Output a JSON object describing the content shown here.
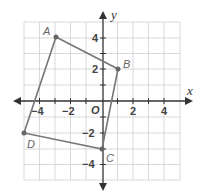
{
  "diagram": {
    "type": "coordinate-plane-quadrilateral",
    "axes": {
      "x_label": "x",
      "y_label": "y",
      "origin_label": "O",
      "x_tick_labels": [
        "−4",
        "−2",
        "2",
        "4"
      ],
      "y_tick_labels": [
        "4",
        "2",
        "−2",
        "−4"
      ],
      "range": {
        "x": [
          -5,
          5
        ],
        "y": [
          -5,
          5
        ]
      }
    },
    "points": [
      {
        "label": "A",
        "x": -3,
        "y": 4
      },
      {
        "label": "B",
        "x": 1,
        "y": 2
      },
      {
        "label": "C",
        "x": 0,
        "y": -3
      },
      {
        "label": "D",
        "x": -5,
        "y": -2
      }
    ],
    "colors": {
      "grid": "#cccccc",
      "shape": "#777777",
      "axis": "#333333"
    }
  }
}
